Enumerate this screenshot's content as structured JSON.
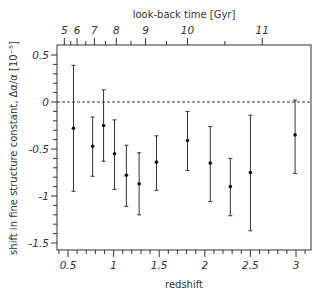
{
  "chart_data": {
    "type": "scatter",
    "title": "",
    "xlabel": "redshift",
    "ylabel": "shift in fine structure constant, Δα/α [10⁻⁵]",
    "top_xlabel": "look-back time [Gyr]",
    "xlim": [
      0.4,
      3.16
    ],
    "ylim": [
      -1.6,
      0.58
    ],
    "x_ticks": [
      0.5,
      1,
      1.5,
      2,
      2.5,
      3
    ],
    "x_tick_labels": [
      "0.5",
      "1",
      "1.5",
      "2",
      "2.5",
      "3"
    ],
    "y_ticks": [
      0.5,
      0,
      -0.5,
      -1,
      -1.5
    ],
    "y_tick_labels": [
      "0.5",
      "0",
      "-0.5",
      "-1",
      "-1.5"
    ],
    "top_ticks": [
      {
        "label": "5",
        "z": 0.46
      },
      {
        "label": "6",
        "z": 0.6
      },
      {
        "label": "7",
        "z": 0.79
      },
      {
        "label": "8",
        "z": 1.03
      },
      {
        "label": "9",
        "z": 1.35
      },
      {
        "label": "10",
        "z": 1.81
      },
      {
        "label": "11",
        "z": 2.63
      }
    ],
    "reference_line": {
      "y": 0,
      "style": "dashed"
    },
    "grid": false,
    "legend": null,
    "series": [
      {
        "name": "measurements",
        "points": [
          {
            "x": 0.56,
            "y": -0.28,
            "ylow": -0.95,
            "yhigh": 0.39
          },
          {
            "x": 0.77,
            "y": -0.47,
            "ylow": -0.79,
            "yhigh": -0.16
          },
          {
            "x": 0.89,
            "y": -0.25,
            "ylow": -0.63,
            "yhigh": 0.13
          },
          {
            "x": 1.01,
            "y": -0.55,
            "ylow": -0.93,
            "yhigh": -0.19
          },
          {
            "x": 1.14,
            "y": -0.78,
            "ylow": -1.11,
            "yhigh": -0.46
          },
          {
            "x": 1.28,
            "y": -0.87,
            "ylow": -1.2,
            "yhigh": -0.54
          },
          {
            "x": 1.47,
            "y": -0.64,
            "ylow": -0.94,
            "yhigh": -0.36
          },
          {
            "x": 1.81,
            "y": -0.41,
            "ylow": -0.73,
            "yhigh": -0.1
          },
          {
            "x": 2.06,
            "y": -0.65,
            "ylow": -1.06,
            "yhigh": -0.26
          },
          {
            "x": 2.28,
            "y": -0.9,
            "ylow": -1.21,
            "yhigh": -0.6
          },
          {
            "x": 2.5,
            "y": -0.75,
            "ylow": -1.37,
            "yhigh": -0.14
          },
          {
            "x": 2.99,
            "y": -0.35,
            "ylow": -0.76,
            "yhigh": 0.02
          }
        ]
      }
    ]
  }
}
